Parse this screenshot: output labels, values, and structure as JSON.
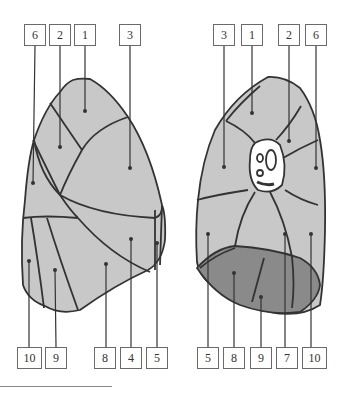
{
  "figure": {
    "type": "anatomical segment diagram (two views)",
    "colors": {
      "lobe_fill": "#c8c8c8",
      "base_fill": "#8a8a8a",
      "outline": "#333333",
      "hilum_fill": "#ffffff"
    }
  },
  "left_view": {
    "top_labels": [
      "6",
      "2",
      "1",
      "3"
    ],
    "bottom_labels": [
      "10",
      "9",
      "8",
      "4",
      "5"
    ]
  },
  "right_view": {
    "top_labels": [
      "3",
      "1",
      "2",
      "6"
    ],
    "bottom_labels": [
      "5",
      "8",
      "9",
      "7",
      "10"
    ]
  }
}
